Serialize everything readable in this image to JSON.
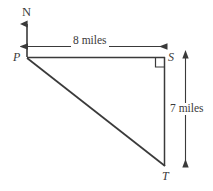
{
  "figure": {
    "background_color": "#ffffff",
    "stroke_color": "#3a3a3a",
    "vertices": {
      "P": {
        "label": "P",
        "x": 27,
        "y": 57
      },
      "S": {
        "label": "S",
        "x": 165,
        "y": 57
      },
      "T": {
        "label": "T",
        "x": 165,
        "y": 166
      }
    },
    "compass": {
      "label": "N",
      "direction": "north",
      "origin_x": 27,
      "tip_y": 22
    },
    "dimensions": [
      {
        "name": "top-horizontal",
        "label": "8 miles",
        "value": 8,
        "unit": "miles",
        "from": "P",
        "to": "S",
        "orientation": "horizontal"
      },
      {
        "name": "right-vertical",
        "label": "7 miles",
        "value": 7,
        "unit": "miles",
        "from": "S",
        "to": "T",
        "orientation": "vertical"
      }
    ],
    "right_angle": {
      "at": "S",
      "marker": "square",
      "size": 9
    }
  }
}
